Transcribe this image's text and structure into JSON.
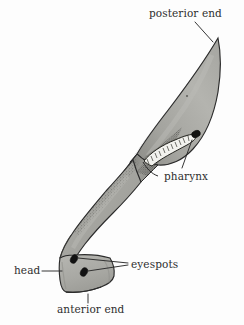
{
  "figure": {
    "organism": "planarian flatworm",
    "view": "dorsal, body twisted/folded",
    "background_color": "#fdfdfd",
    "body_fill_color": "#a9a9a4",
    "body_fill_color_light": "#bdbdb8",
    "body_fill_color_dark": "#8d8d88",
    "outline_color": "#2b2b2b",
    "stipple_color": "#4a4a46",
    "eyespot_color": "#141414",
    "pharynx_fill_color": "#f2f2ee",
    "label_color": "#2e2e2e",
    "leader_line_color": "#2b2b2b"
  },
  "labels": [
    {
      "id": "posterior-end",
      "text": "posterior end",
      "position": "top-right",
      "points_to": "tapered pointed tail tip of the body"
    },
    {
      "id": "pharynx",
      "text": "pharynx",
      "position": "right-middle",
      "points_to": "striated tube with dark oval opening in the mid-body cavity"
    },
    {
      "id": "eyespots",
      "text": "eyespots",
      "position": "lower-right",
      "points_to": "two dark ovals on the head"
    },
    {
      "id": "head",
      "text": "head",
      "position": "lower-left",
      "points_to": "blunt squared anterior region of the body"
    },
    {
      "id": "anterior-end",
      "text": "anterior end",
      "position": "bottom-center",
      "points_to": "front-most edge of the head"
    }
  ],
  "structures": [
    {
      "id": "posterior-lobe",
      "name": "posterior lobe",
      "description": "broad leaf/blade shaped rear half of the body, tapering to a point at upper right"
    },
    {
      "id": "mid-body-fold",
      "name": "mid-body fold",
      "description": "twisted band where the body folds over on itself, heavily stippled along the fold edge"
    },
    {
      "id": "anterior-lobe",
      "name": "anterior lobe",
      "description": "elongated lower-left portion running down to the head"
    },
    {
      "id": "head-region",
      "name": "head",
      "description": "blunt squarish region at the bottom bearing the eyespots"
    },
    {
      "id": "pharynx-tube",
      "name": "pharynx",
      "description": "pale curved tube with ladder-like striations and a dark oval mouth opening"
    },
    {
      "id": "eyespot-upper",
      "name": "upper eyespot",
      "description": "tilted dark ellipse"
    },
    {
      "id": "eyespot-lower",
      "name": "lower eyespot",
      "description": "tilted dark ellipse below and right of the upper one"
    }
  ]
}
